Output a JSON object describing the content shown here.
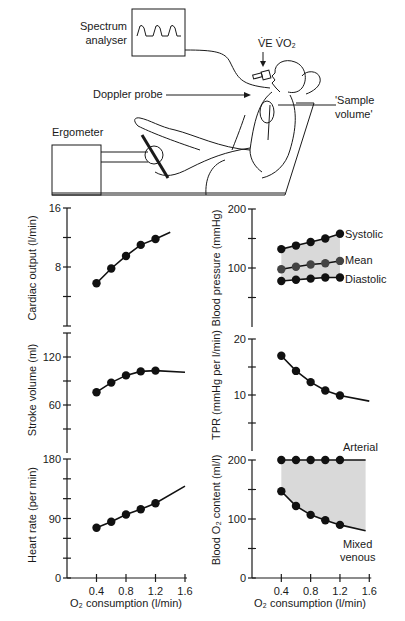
{
  "apparatus": {
    "spectrum_analyser_label_line1": "Spectrum",
    "spectrum_analyser_label_line2": "analyser",
    "ventilation_label": "V̇E V̇O₂",
    "doppler_probe_label": "Doppler probe",
    "sample_volume_label_line1": "'Sample",
    "sample_volume_label_line2": "volume'",
    "ergometer_label": "Ergometer"
  },
  "x_axis": {
    "label": "O₂ consumption (l/min)",
    "ticks": [
      "0.4",
      "0.8",
      "1.2",
      "1.6"
    ]
  },
  "chart_data": [
    {
      "type": "line",
      "title": "",
      "xlabel": "O₂ consumption (l/min)",
      "ylabel": "Cardiac output (l/min)",
      "x": [
        0.4,
        0.6,
        0.8,
        1.0,
        1.2
      ],
      "values": [
        5.8,
        7.8,
        9.5,
        11.0,
        11.8
      ],
      "fit_end": {
        "x": 1.4,
        "y": 12.7
      },
      "ylim": [
        0,
        16
      ],
      "y_ticks": [
        "8",
        "16"
      ],
      "grid": false
    },
    {
      "type": "line",
      "xlabel": "O₂ consumption (l/min)",
      "ylabel": "Stroke volume (ml)",
      "x": [
        0.4,
        0.6,
        0.8,
        1.0,
        1.2
      ],
      "values": [
        76,
        88,
        97,
        102,
        103
      ],
      "fit_end": {
        "x": 1.6,
        "y": 101
      },
      "ylim": [
        0,
        150
      ],
      "y_ticks": [
        "60",
        "120"
      ],
      "grid": false
    },
    {
      "type": "line",
      "xlabel": "O₂ consumption (l/min)",
      "ylabel": "Heart rate (per min)",
      "x": [
        0.4,
        0.6,
        0.8,
        1.0,
        1.2
      ],
      "values": [
        76,
        85,
        96,
        104,
        113
      ],
      "fit_end": {
        "x": 1.6,
        "y": 139
      },
      "ylim": [
        0,
        180
      ],
      "y_ticks": [
        "0",
        "90",
        "180"
      ],
      "grid": false
    },
    {
      "type": "line",
      "xlabel": "O₂ consumption (l/min)",
      "ylabel": "Blood pressure (mmHg)",
      "x": [
        0.4,
        0.6,
        0.8,
        1.0,
        1.2
      ],
      "series": [
        {
          "name": "Systolic",
          "values": [
            132,
            138,
            144,
            150,
            158
          ]
        },
        {
          "name": "Mean",
          "values": [
            98,
            102,
            106,
            108,
            112
          ]
        },
        {
          "name": "Diastolic",
          "values": [
            78,
            80,
            82,
            84,
            84
          ]
        }
      ],
      "shaded_between": [
        "Systolic",
        "Diastolic"
      ],
      "ylim": [
        0,
        200
      ],
      "y_ticks": [
        "100",
        "200"
      ],
      "grid": false
    },
    {
      "type": "line",
      "xlabel": "O₂ consumption (l/min)",
      "ylabel": "TPR (mmHg per l/min)",
      "x": [
        0.4,
        0.6,
        0.8,
        1.0,
        1.2
      ],
      "values": [
        17.0,
        14.3,
        12.3,
        10.8,
        9.9
      ],
      "fit_end": {
        "x": 1.6,
        "y": 8.9
      },
      "ylim": [
        0,
        20
      ],
      "y_ticks": [
        "10",
        "20"
      ],
      "grid": false
    },
    {
      "type": "line",
      "xlabel": "O₂ consumption (l/min)",
      "ylabel": "Blood O₂ content (ml/l)",
      "x": [
        0.4,
        0.6,
        0.8,
        1.0,
        1.2
      ],
      "series": [
        {
          "name": "Arterial",
          "values": [
            200,
            200,
            200,
            200,
            200
          ],
          "fit_end": {
            "x": 1.55,
            "y": 200
          }
        },
        {
          "name": "Mixed venous",
          "values": [
            147,
            122,
            107,
            98,
            90
          ],
          "fit_end": {
            "x": 1.55,
            "y": 80
          }
        }
      ],
      "shaded_between": [
        "Arterial",
        "Mixed venous"
      ],
      "ylim": [
        0,
        200
      ],
      "y_ticks": [
        "0",
        "100",
        "200"
      ],
      "x_ticks": [
        "0.4",
        "0.8",
        "1.2",
        "1.6"
      ],
      "grid": false
    }
  ],
  "labels": {
    "co_ylabel": "Cardiac output (l/min)",
    "sv_ylabel": "Stroke volume (ml)",
    "hr_ylabel": "Heart rate (per min)",
    "bp_ylabel": "Blood pressure (mmHg)",
    "tpr_ylabel": "TPR (mmHg per l/min)",
    "o2_ylabel": "Blood O₂ content (ml/l)",
    "systolic": "Systolic",
    "mean": "Mean",
    "diastolic": "Diastolic",
    "arterial": "Arterial",
    "mixed_line1": "Mixed",
    "mixed_line2": "venous"
  }
}
